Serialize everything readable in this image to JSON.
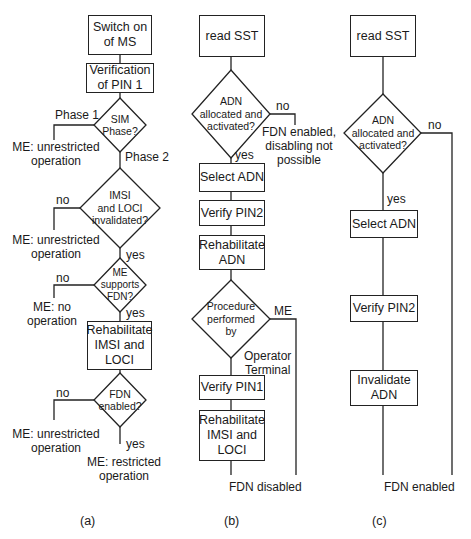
{
  "figure": {
    "panels": [
      {
        "id": "a",
        "caption": "(a)",
        "boxes": {
          "switch_on": "Switch on\nof MS",
          "verify_pin1": "Verification\nof PIN 1",
          "rehab_imsi": "Rehabilitate\nIMSI and\nLOCI"
        },
        "decisions": {
          "sim_phase": "SIM\nPhase?",
          "imsi_loci": "IMSI\nand LOCI\ninvalidated?",
          "me_supports_fdn": "ME\nsupports\nFDN?",
          "fdn_enabled": "FDN\nenabled?"
        },
        "labels": {
          "phase1": "Phase 1",
          "phase2": "Phase 2",
          "unrestricted_1": "ME: unrestricted\noperation",
          "no_1": "no",
          "unrestricted_2": "ME: unrestricted\noperation",
          "yes_1": "yes",
          "no_2": "no",
          "no_operation": "ME: no\noperation",
          "yes_2": "yes",
          "no_3": "no",
          "unrestricted_3": "ME: unrestricted\noperation",
          "yes_3": "yes",
          "restricted": "ME: restricted\noperation"
        }
      },
      {
        "id": "b",
        "caption": "(b)",
        "boxes": {
          "read_sst": "read SST",
          "select_adn": "Select ADN",
          "verify_pin2": "Verify PIN2",
          "rehab_adn": "Rehabilitate\nADN",
          "verify_pin1": "Verify PIN1",
          "rehab_imsi": "Rehabilitate\nIMSI and\nLOCI"
        },
        "decisions": {
          "adn_alloc": "ADN\nallocated and\nactivated?",
          "procedure_by": "Procedure\nperformed\nby"
        },
        "labels": {
          "no": "no",
          "fdn_not_possible": "FDN enabled,\ndisabling not\npossible",
          "yes": "yes",
          "me": "ME",
          "operator_terminal": "Operator\nTerminal",
          "fdn_disabled": "FDN disabled"
        }
      },
      {
        "id": "c",
        "caption": "(c)",
        "boxes": {
          "read_sst": "read SST",
          "select_adn": "Select ADN",
          "verify_pin2": "Verify PIN2",
          "invalidate_adn": "Invalidate\nADN"
        },
        "decisions": {
          "adn_alloc": "ADN\nallocated and\nactivated?"
        },
        "labels": {
          "no": "no",
          "yes": "yes",
          "fdn_enabled": "FDN enabled"
        }
      }
    ]
  }
}
